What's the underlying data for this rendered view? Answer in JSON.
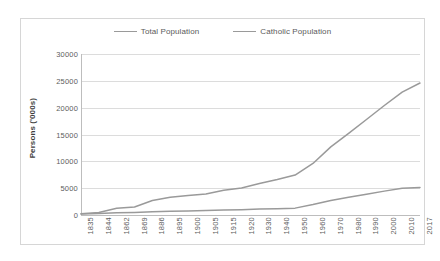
{
  "chart_data": {
    "type": "line",
    "title": "",
    "xlabel": "",
    "ylabel": "Persons ('000s)",
    "ylim": [
      0,
      30000
    ],
    "ytick_values": [
      0,
      5000,
      10000,
      15000,
      20000,
      25000,
      30000
    ],
    "ytick_labels": [
      "0",
      "5000",
      "10000",
      "15000",
      "20000",
      "25000",
      "30000"
    ],
    "grid": "horizontal",
    "legend_position": "top-center",
    "categories": [
      "1835",
      "1844",
      "1862",
      "1869",
      "1886",
      "1895",
      "1900",
      "1905",
      "1915",
      "1920",
      "1930",
      "1940",
      "1950",
      "1960",
      "1970",
      "1980",
      "1990",
      "2000",
      "2010",
      "2017"
    ],
    "series": [
      {
        "name": "Total Population",
        "color": "#9a9a9a",
        "values": [
          250,
          450,
          1250,
          1500,
          2700,
          3300,
          3650,
          3900,
          4600,
          5050,
          5850,
          6600,
          7450,
          9600,
          12700,
          15200,
          17800,
          20400,
          22900,
          24600
        ]
      },
      {
        "name": "Catholic Population",
        "color": "#9a9a9a",
        "values": [
          180,
          260,
          400,
          480,
          620,
          700,
          760,
          820,
          930,
          1000,
          1100,
          1180,
          1280,
          1950,
          2700,
          3300,
          3850,
          4450,
          5000,
          5120
        ]
      }
    ]
  },
  "legend": {
    "entries": [
      {
        "label": "Total Population"
      },
      {
        "label": "Catholic Population"
      }
    ]
  }
}
